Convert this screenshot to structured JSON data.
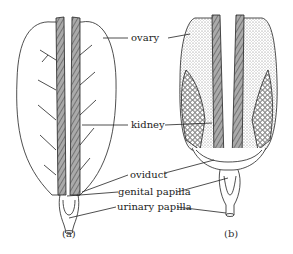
{
  "figure": {
    "labels": {
      "ovary": "ovary",
      "kidney": "kidney",
      "oviduct": "oviduct",
      "genital_papilla": "genital papilla",
      "urinary_papilla": "urinary papilla"
    },
    "panels": [
      {
        "caption": "(a)",
        "description": "immature female urogenital system"
      },
      {
        "caption": "(b)",
        "description": "mature female urogenital system with ripe eggs"
      }
    ],
    "colors": {
      "line": "#222222",
      "stipple": "#9a9a9a",
      "background": "#ffffff"
    }
  }
}
